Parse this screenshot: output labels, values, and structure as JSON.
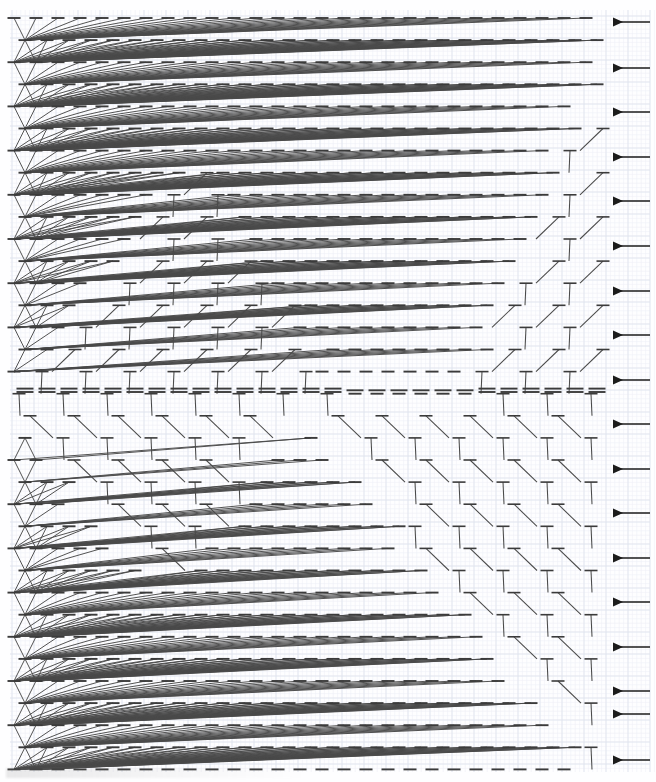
{
  "figure": {
    "title": "Triangular lattice cable-stitch / Tanner graph diagram",
    "type": "diagram",
    "canvas": {
      "width": 656,
      "height": 782,
      "background": "#fefeff"
    },
    "plot_area": {
      "x": 12,
      "y": 16,
      "width": 600,
      "height": 752
    }
  },
  "grid": {
    "visible": true,
    "minor_spacing_px": 4.4,
    "major_spacing_px": 22,
    "minor_color": "#eef0f6",
    "major_color": "#dfe3ee"
  },
  "lattice": {
    "description": "Triangular (hexagonal-dual) lattice of horizontal node bars joined by diagonal edges",
    "node_marker": "horizontal-bar",
    "node_bar_width_px": 13,
    "node_bar_color": "#3b3b3b",
    "edge_color": "#4a4a4a",
    "col_pitch_px": 22,
    "row_pitch_px": 22.1,
    "row_count": 35,
    "col_count": 28,
    "waist_row_index": 17,
    "waist_y_px": 392,
    "double_bar_rows": [
      17
    ],
    "regions": [
      {
        "name": "upper-left-triangle",
        "shape": "right-triangle",
        "orientation": "apex-down-right",
        "corner": "top-left"
      },
      {
        "name": "upper-right-inverted-triangle",
        "shape": "triangle",
        "orientation": "apex-down",
        "corner": "top-center-right"
      },
      {
        "name": "lower-left-triangle",
        "shape": "triangle",
        "orientation": "apex-up",
        "corner": "bottom-left"
      },
      {
        "name": "lower-center-triangle",
        "shape": "triangle",
        "orientation": "apex-up",
        "corner": "bottom-center"
      },
      {
        "name": "sparse-zigzag-band",
        "shape": "chevron-columns",
        "orientation": "vertical-v-chains"
      }
    ]
  },
  "arrows": {
    "count": 18,
    "direction": "left",
    "color": "#1b1b1b",
    "x_tail_px": 650,
    "x_head_px": 614,
    "label": "row-marker-arrow",
    "y_positions_px": [
      22,
      68,
      112,
      157,
      201,
      246,
      291,
      335,
      380,
      424,
      469,
      513,
      558,
      602,
      647,
      691,
      714,
      760
    ]
  },
  "legend": {
    "visible": false,
    "entries": []
  },
  "annotations": [],
  "chart_data": {
    "type": "table",
    "xlabel": "",
    "ylabel": "",
    "categories": [],
    "values": []
  }
}
